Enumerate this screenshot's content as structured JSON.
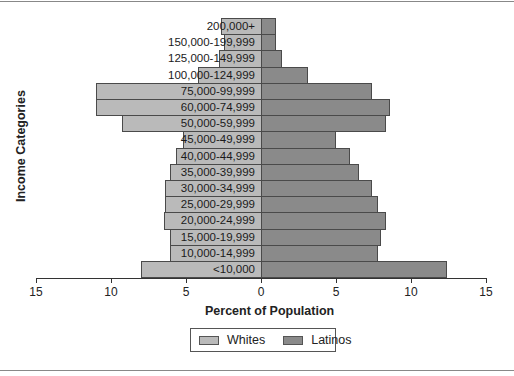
{
  "chart_data": {
    "type": "bar",
    "orientation": "horizontal-population-pyramid",
    "title": "",
    "xlabel": "Percent of Population",
    "ylabel": "Income Categories",
    "xlim": [
      -15,
      15
    ],
    "xticks": [
      -15,
      -10,
      -5,
      0,
      5,
      10,
      15
    ],
    "xtick_labels": [
      "15",
      "10",
      "5",
      "0",
      "5",
      "10",
      "15"
    ],
    "categories": [
      "200,000+",
      "150,000-199,999",
      "125,000-149,999",
      "100,000-124,999",
      "75,000-99,999",
      "60,000-74,999",
      "50,000-59,999",
      "45,000-49,999",
      "40,000-44,999",
      "35,000-39,999",
      "30,000-34,999",
      "25,000-29,999",
      "20,000-24,999",
      "15,000-19,999",
      "10,000-14,999",
      "<10,000"
    ],
    "series": [
      {
        "name": "Whites",
        "side": "left",
        "color": "#bababa",
        "values": [
          2.7,
          2.5,
          2.8,
          4.2,
          11.0,
          11.0,
          9.3,
          5.2,
          5.7,
          6.1,
          6.4,
          6.4,
          6.5,
          6.1,
          6.1,
          8.0
        ]
      },
      {
        "name": "Latinos",
        "side": "right",
        "color": "#8a8a8a",
        "values": [
          1.0,
          1.0,
          1.4,
          3.1,
          7.4,
          8.6,
          8.3,
          5.0,
          5.9,
          6.5,
          7.4,
          7.8,
          8.3,
          8.0,
          7.8,
          12.4
        ]
      }
    ],
    "legend": {
      "position": "bottom-center",
      "entries": [
        "Whites",
        "Latinos"
      ]
    },
    "grid": false
  }
}
